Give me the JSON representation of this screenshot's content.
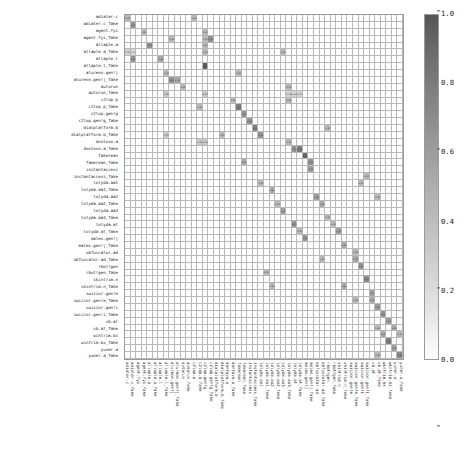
{
  "chart_data": {
    "type": "heatmap",
    "title": "",
    "xlabel": "",
    "ylabel": "",
    "colormap": "Greys",
    "grid": true,
    "legend_position": "right",
    "colorbar": {
      "vmin": 0.0,
      "vmax": 1.0,
      "ticks": [
        "0.0",
        "0.2",
        "0.4",
        "0.6",
        "0.8",
        "1.0"
      ],
      "tick_values": [
        0.0,
        0.2,
        0.4,
        0.6,
        0.8,
        1.0
      ],
      "orientation": "vertical"
    },
    "categories": [
      "adialer.c",
      "adialer.c_fake",
      "agent.fyi",
      "agent.fyi_fake",
      "allaple.a",
      "allaple.a_fake",
      "allaple.l",
      "allaple.l_fake",
      "alureon.gen!j",
      "alureon.gen!j_fake",
      "autorun",
      "autorun_fake",
      "c2lop.p",
      "c2lop.p_fake",
      "c2lop.gen!g",
      "c2lop.gen!g_fake",
      "dialplatform.b",
      "dialplatform.b_fake",
      "dontovo.a",
      "dontovo.a_fake",
      "fakerean",
      "fakerean_fake",
      "instantaccess",
      "instantaccess_fake",
      "lolyda.aa1",
      "lolyda.aa1_fake",
      "lolyda.aa2",
      "lolyda.aa2_fake",
      "lolyda.aa3",
      "lolyda.aa3_fake",
      "lolyda.at",
      "lolyda.at_fake",
      "malex.gen!j",
      "malex.gen!j_fake",
      "obfuscator.ad",
      "obfuscator.ad_fake",
      "rbot!gen",
      "rbot!gen_fake",
      "skintrim.n",
      "skintrim.n_fake",
      "swizzor.gen!e",
      "swizzor.gen!e_fake",
      "swizzor.gen!i",
      "swizzor.gen!i_fake",
      "vb.at",
      "vb.at_fake",
      "wintrim.bx",
      "wintrim.bx_fake",
      "yuner.a",
      "yuner.a_fake"
    ],
    "x_categories": [
      "adialer.c",
      "adialer.c_fake",
      "agent.fyi",
      "agent.fyi_fake",
      "allaple.a",
      "allaple.a_fake",
      "allaple.l",
      "allaple.l_fake",
      "alureon.gen!j",
      "alureon.gen!j_fake",
      "autorun",
      "autorun_fake",
      "c2lop.p",
      "c2lop.p_fake",
      "c2lop.gen!g",
      "c2lop.gen!g_fake",
      "dialplatform.b",
      "dialplatform.b_fake",
      "dontovo.a",
      "dontovo.a_fake",
      "fakerean",
      "fakerean_fake",
      "instantaccess",
      "instantaccess_fake",
      "lolyda.aa1",
      "lolyda.aa1_fake",
      "lolyda.aa2",
      "lolyda.aa2_fake",
      "lolyda.aa3",
      "lolyda.aa3_fake",
      "lolyda.at",
      "lolyda.at_fake",
      "malex.gen!j",
      "malex.gen!j_fake",
      "obfuscator.ad",
      "obfuscator.ad_fake",
      "rbot!gen",
      "rbot!gen_fake",
      "skintrim.n",
      "skintrim.n_fake",
      "swizzor.gen!e",
      "swizzor.gen!e_fake",
      "swizzor.gen!i",
      "swizzor.gen!i_fake",
      "vb.at",
      "vb.at_fake",
      "wintrim.bx",
      "wintrim.bx_fake",
      "yuner.a",
      "yuner.a_fake"
    ],
    "cells": [
      {
        "row": 0,
        "col": 0,
        "value": 0.33
      },
      {
        "row": 0,
        "col": 12,
        "value": 0.33
      },
      {
        "row": 1,
        "col": 1,
        "value": 0.5
      },
      {
        "row": 2,
        "col": 14,
        "value": 0.33
      },
      {
        "row": 3,
        "col": 8,
        "value": 0.33
      },
      {
        "row": 3,
        "col": 14,
        "value": 0.33
      },
      {
        "row": 3,
        "col": 15,
        "value": 0.5
      },
      {
        "row": 4,
        "col": 14,
        "value": 0.33
      },
      {
        "row": 5,
        "col": 0,
        "value": 0.2
      },
      {
        "row": 5,
        "col": 1,
        "value": 0.17
      },
      {
        "row": 5,
        "col": 14,
        "value": 0.33
      },
      {
        "row": 5,
        "col": 28,
        "value": 0.33
      },
      {
        "row": 6,
        "col": 1,
        "value": 0.5
      },
      {
        "row": 7,
        "col": 14,
        "value": 0.75
      },
      {
        "row": 8,
        "col": 7,
        "value": 0.33
      },
      {
        "row": 8,
        "col": 20,
        "value": 0.33
      },
      {
        "row": 9,
        "col": 8,
        "value": 0.5
      },
      {
        "row": 10,
        "col": 29,
        "value": 0.33
      },
      {
        "row": 11,
        "col": 7,
        "value": 0.25
      },
      {
        "row": 11,
        "col": 14,
        "value": 0.25
      },
      {
        "row": 11,
        "col": 29,
        "value": 0.2
      },
      {
        "row": 11,
        "col": 30,
        "value": 0.2
      },
      {
        "row": 11,
        "col": 31,
        "value": 0.2
      },
      {
        "row": 12,
        "col": 19,
        "value": 0.33
      },
      {
        "row": 12,
        "col": 29,
        "value": 0.33
      },
      {
        "row": 13,
        "col": 20,
        "value": 0.6
      },
      {
        "row": 14,
        "col": 21,
        "value": 0.5
      },
      {
        "row": 15,
        "col": 22,
        "value": 0.5
      },
      {
        "row": 16,
        "col": 23,
        "value": 0.6
      },
      {
        "row": 16,
        "col": 36,
        "value": 0.33
      },
      {
        "row": 17,
        "col": 7,
        "value": 0.25
      },
      {
        "row": 17,
        "col": 24,
        "value": 0.5
      },
      {
        "row": 18,
        "col": 13,
        "value": 0.25
      },
      {
        "row": 18,
        "col": 14,
        "value": 0.25
      },
      {
        "row": 18,
        "col": 29,
        "value": 0.33
      },
      {
        "row": 19,
        "col": 30,
        "value": 0.5
      },
      {
        "row": 19,
        "col": 31,
        "value": 0.6
      },
      {
        "row": 20,
        "col": 32,
        "value": 0.7
      },
      {
        "row": 21,
        "col": 33,
        "value": 0.5
      },
      {
        "row": 22,
        "col": 33,
        "value": 0.45
      },
      {
        "row": 23,
        "col": 43,
        "value": 0.33
      },
      {
        "row": 24,
        "col": 42,
        "value": 0.33
      },
      {
        "row": 25,
        "col": 26,
        "value": 0.4
      },
      {
        "row": 26,
        "col": 34,
        "value": 0.45
      },
      {
        "row": 26,
        "col": 45,
        "value": 0.33
      },
      {
        "row": 27,
        "col": 35,
        "value": 0.4
      },
      {
        "row": 28,
        "col": 28,
        "value": 0.45
      },
      {
        "row": 29,
        "col": 36,
        "value": 0.33
      },
      {
        "row": 30,
        "col": 30,
        "value": 0.5
      },
      {
        "row": 30,
        "col": 37,
        "value": 0.33
      },
      {
        "row": 31,
        "col": 38,
        "value": 0.45
      },
      {
        "row": 32,
        "col": 32,
        "value": 0.5
      },
      {
        "row": 33,
        "col": 39,
        "value": 0.4
      },
      {
        "row": 34,
        "col": 41,
        "value": 0.33
      },
      {
        "row": 35,
        "col": 41,
        "value": 0.4
      },
      {
        "row": 36,
        "col": 42,
        "value": 0.5
      },
      {
        "row": 37,
        "col": 25,
        "value": 0.33
      },
      {
        "row": 38,
        "col": 43,
        "value": 0.55
      },
      {
        "row": 39,
        "col": 26,
        "value": 0.33
      },
      {
        "row": 40,
        "col": 44,
        "value": 0.45
      },
      {
        "row": 41,
        "col": 44,
        "value": 0.4
      },
      {
        "row": 42,
        "col": 45,
        "value": 0.45
      },
      {
        "row": 43,
        "col": 46,
        "value": 0.5
      },
      {
        "row": 44,
        "col": 47,
        "value": 0.45
      },
      {
        "row": 45,
        "col": 48,
        "value": 0.4
      },
      {
        "row": 46,
        "col": 46,
        "value": 0.4
      },
      {
        "row": 46,
        "col": 49,
        "value": 0.33
      },
      {
        "row": 47,
        "col": 47,
        "value": 0.6
      },
      {
        "row": 48,
        "col": 48,
        "value": 0.45
      },
      {
        "row": 49,
        "col": 49,
        "value": 0.55
      },
      {
        "row": 2,
        "col": 3,
        "value": 0.33
      },
      {
        "row": 4,
        "col": 4,
        "value": 0.5
      },
      {
        "row": 6,
        "col": 6,
        "value": 0.4
      },
      {
        "row": 9,
        "col": 9,
        "value": 0.4
      },
      {
        "row": 10,
        "col": 10,
        "value": 0.33
      },
      {
        "row": 13,
        "col": 13,
        "value": 0.33
      },
      {
        "row": 17,
        "col": 17,
        "value": 0.33
      },
      {
        "row": 21,
        "col": 21,
        "value": 0.4
      },
      {
        "row": 24,
        "col": 24,
        "value": 0.33
      },
      {
        "row": 27,
        "col": 27,
        "value": 0.33
      },
      {
        "row": 31,
        "col": 31,
        "value": 0.33
      },
      {
        "row": 35,
        "col": 35,
        "value": 0.33
      },
      {
        "row": 39,
        "col": 39,
        "value": 0.4
      },
      {
        "row": 41,
        "col": 41,
        "value": 0.33
      },
      {
        "row": 45,
        "col": 45,
        "value": 0.33
      },
      {
        "row": 49,
        "col": 45,
        "value": 0.33
      }
    ]
  }
}
